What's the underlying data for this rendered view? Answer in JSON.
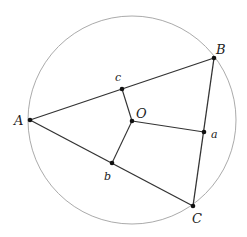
{
  "diagram": {
    "colors": {
      "circle": "#a0a0a0",
      "lines": "#333333",
      "points": "#111111",
      "labels": "#222222"
    },
    "circle": {
      "cx": 132,
      "cy": 120,
      "r": 104
    },
    "points": {
      "A": {
        "x": 30,
        "y": 120,
        "label": "A"
      },
      "B": {
        "x": 214,
        "y": 58,
        "label": "B"
      },
      "C": {
        "x": 193,
        "y": 206,
        "label": "C"
      },
      "O": {
        "x": 132,
        "y": 121,
        "label": "O"
      },
      "a": {
        "x": 204,
        "y": 132,
        "label": "a"
      },
      "b": {
        "x": 112,
        "y": 163,
        "label": "b"
      },
      "c": {
        "x": 122,
        "y": 89,
        "label": "c"
      }
    },
    "segments": [
      [
        "A",
        "B"
      ],
      [
        "B",
        "C"
      ],
      [
        "C",
        "A"
      ],
      [
        "O",
        "a"
      ],
      [
        "O",
        "b"
      ],
      [
        "O",
        "c"
      ]
    ]
  }
}
